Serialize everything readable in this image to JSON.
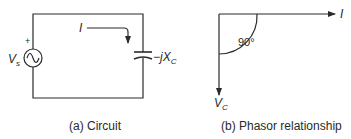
{
  "circuit": {
    "source_label": "V",
    "source_sub": "s",
    "source_polarity": "+",
    "current_label": "I",
    "impedance_prefix": "−j",
    "impedance_label": "X",
    "impedance_sub": "C",
    "caption": "(a) Circuit"
  },
  "phasor": {
    "current_label": "I",
    "voltage_label": "V",
    "voltage_sub": "C",
    "angle_label": "90°",
    "caption": "(b) Phasor relationship"
  },
  "colors": {
    "line": "#2a2a2a",
    "background": "#ffffff"
  }
}
